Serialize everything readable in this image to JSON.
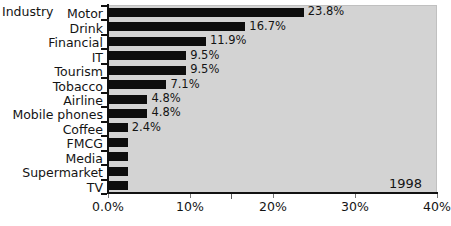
{
  "chart_data": {
    "type": "bar",
    "orientation": "horizontal",
    "title": "",
    "xlabel": "",
    "ylabel": "Industry",
    "categories": [
      "Motor",
      "Drink",
      "Financial",
      "IT",
      "Tourism",
      "Tobacco",
      "Airline",
      "Mobile phones",
      "Coffee",
      "FMCG",
      "Media",
      "Supermarket",
      "TV"
    ],
    "values": [
      23.8,
      16.7,
      11.9,
      9.5,
      9.5,
      7.1,
      4.8,
      4.8,
      2.4,
      2.4,
      2.4,
      2.4,
      2.4
    ],
    "data_labels": [
      "23.8%",
      "16.7%",
      "11.9%",
      "9.5%",
      "9.5%",
      "7.1%",
      "4.8%",
      "4.8%",
      "2.4%",
      "",
      "",
      "",
      ""
    ],
    "xlim": [
      0,
      40
    ],
    "xticks": [
      0,
      10,
      20,
      30,
      40
    ],
    "xtick_labels": [
      "0.0%",
      "10%",
      "20%",
      "30%",
      "40%"
    ],
    "minor_xticks": [
      15
    ],
    "grid": false,
    "legend": "none",
    "annotations": [
      {
        "text": "1998",
        "position": "bottom-right-inside-plot"
      }
    ],
    "colors": {
      "bar": "#0d0d0d",
      "plot_background": "#d3d3d3",
      "figure_background": "#ffffff",
      "axis": "#111111",
      "text": "#141414"
    }
  },
  "axis": {
    "y_title": "Industry"
  },
  "annotation": {
    "year": "1998"
  }
}
